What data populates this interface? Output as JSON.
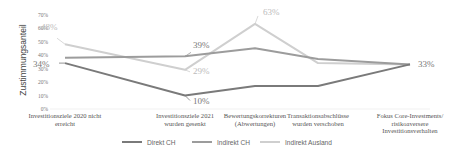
{
  "chart_data": {
    "type": "line",
    "title": "",
    "xlabel": "",
    "ylabel": "Zustimmungsanteil",
    "ylim": [
      0,
      70
    ],
    "yticks": [
      "0%",
      "10%",
      "20%",
      "30%",
      "40%",
      "50%",
      "60%",
      "70%"
    ],
    "grid": false,
    "legend_position": "bottom",
    "categories": [
      [
        "Investitionsziele 2020 nicht",
        "erreicht"
      ],
      [
        "Investitionsziele 2021",
        "wurden gesenkt"
      ],
      [
        "Bewertungskorrekturen",
        "(Abwertungen)"
      ],
      [
        "Transaktionsabschlüsse",
        "wurden verschoben"
      ],
      [
        "Fokus Core-Investments/",
        "risikoaversere",
        "Investitionsverhalten"
      ]
    ],
    "series": [
      {
        "name": "Direkt CH",
        "color": "#7a7a7a",
        "values": [
          34,
          10,
          17,
          17,
          33
        ]
      },
      {
        "name": "Indirekt CH",
        "color": "#9c9c9c",
        "values": [
          38,
          39,
          45,
          37,
          33
        ]
      },
      {
        "name": "Indirekt Ausland",
        "color": "#cfcfcf",
        "values": [
          48,
          29,
          63,
          34,
          33
        ]
      }
    ],
    "annotations": [
      {
        "series": "Indirekt Ausland",
        "index": 0,
        "text": "48%"
      },
      {
        "series": "Direkt CH",
        "index": 0,
        "text": "34%"
      },
      {
        "series": "Indirekt CH",
        "index": 1,
        "text": "39%"
      },
      {
        "series": "Indirekt Ausland",
        "index": 1,
        "text": "29%"
      },
      {
        "series": "Direkt CH",
        "index": 1,
        "text": "10%"
      },
      {
        "series": "Indirekt Ausland",
        "index": 2,
        "text": "63%"
      },
      {
        "series": "Direkt CH",
        "index": 4,
        "text": "33%"
      }
    ]
  }
}
